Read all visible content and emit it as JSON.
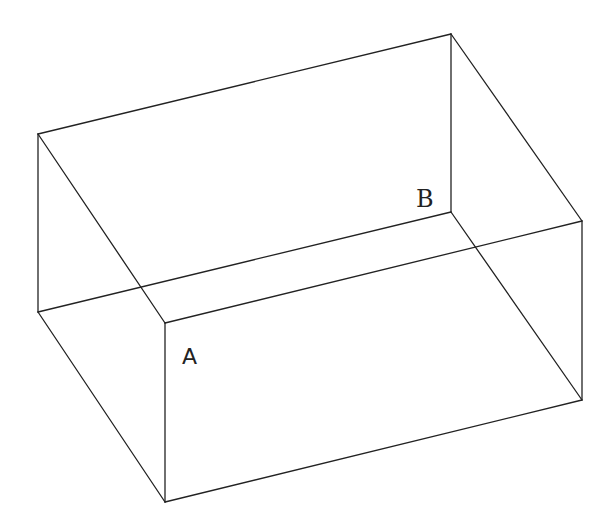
{
  "diagram": {
    "type": "wireframe-cuboid",
    "stroke_color": "#222222",
    "background_color": "#ffffff",
    "vertices": {
      "top_back_left": [
        38,
        134
      ],
      "top_back_right": [
        451,
        34
      ],
      "top_front_right": [
        582,
        221
      ],
      "top_front_left": [
        165,
        323
      ],
      "bottom_back_left": [
        38,
        312
      ],
      "bottom_back_right": [
        451,
        212
      ],
      "bottom_front_right": [
        582,
        400
      ],
      "bottom_front_left": [
        165,
        502
      ]
    },
    "labels": [
      {
        "text": "A",
        "x": 182,
        "y": 364,
        "vertex": "top_front_left"
      },
      {
        "text": "B",
        "x": 417,
        "y": 207,
        "vertex": "bottom_back_right"
      }
    ]
  }
}
